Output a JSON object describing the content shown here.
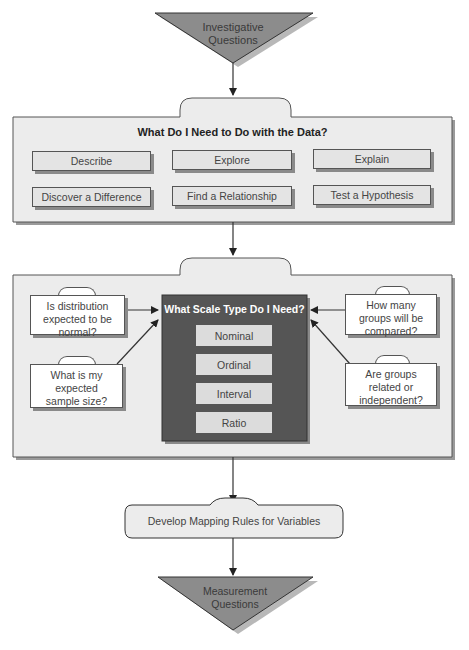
{
  "start": {
    "label_line1": "Investigative",
    "label_line2": "Questions"
  },
  "panel1": {
    "title": "What Do I Need to Do with the Data?",
    "options": [
      {
        "label": "Describe"
      },
      {
        "label": "Explore"
      },
      {
        "label": "Explain"
      },
      {
        "label": "Discover a Difference"
      },
      {
        "label": "Find a Relationship"
      },
      {
        "label": "Test a Hypothesis"
      }
    ]
  },
  "panel2": {
    "title": "What Scale Type Do I Need?",
    "scales": [
      {
        "label": "Nominal"
      },
      {
        "label": "Ordinal"
      },
      {
        "label": "Interval"
      },
      {
        "label": "Ratio"
      }
    ],
    "left_questions": [
      {
        "line1": "Is distribution",
        "line2": "expected to be",
        "line3": "normal?"
      },
      {
        "line1": "What is my",
        "line2": "expected",
        "line3": "sample size?"
      }
    ],
    "right_questions": [
      {
        "line1": "How many",
        "line2": "groups will be",
        "line3": "compared?"
      },
      {
        "line1": "Are groups",
        "line2": "related or",
        "line3": "independent?"
      }
    ]
  },
  "mapping": {
    "label": "Develop Mapping Rules for Variables"
  },
  "end": {
    "label_line1": "Measurement",
    "label_line2": "Questions"
  },
  "colors": {
    "triangle_fill": "#8c8c8c",
    "panel_fill": "#ececec",
    "dark_box": "#555555",
    "shadow": "#8a8a8a",
    "line": "#333333"
  }
}
